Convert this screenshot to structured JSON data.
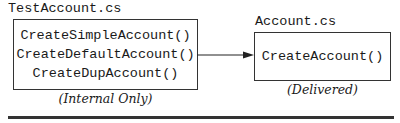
{
  "diagram": {
    "nodes": [
      {
        "id": "test-account",
        "file_label": "TestAccount.cs",
        "methods": [
          "CreateSimpleAccount()",
          "CreateDefaultAccount()",
          "CreateDupAccount()"
        ],
        "caption": "(Internal Only)"
      },
      {
        "id": "account",
        "file_label": "Account.cs",
        "methods": [
          "CreateAccount()"
        ],
        "caption": "(Delivered)"
      }
    ],
    "edges": [
      {
        "from": "test-account",
        "to": "account",
        "type": "arrow"
      }
    ]
  }
}
